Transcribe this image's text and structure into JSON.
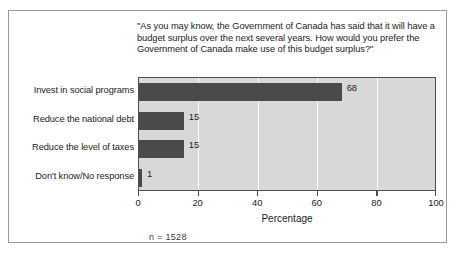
{
  "figure": {
    "question": "\"As you may know, the Government of Canada has said that it will have a budget surplus over the next several years. How would you prefer the Government of Canada make use of this budget surplus?\"",
    "sample_note": "n = 1528",
    "frame_border_color": "#9a9a9a",
    "plot_background_color": "#d8d8d8",
    "bar_color": "#4a4a4a",
    "gridline_color": "#ffffff"
  },
  "chart_data": {
    "type": "bar",
    "orientation": "horizontal",
    "title": "\"As you may know, the Government of Canada has said that it will have a budget surplus over the next several years. How would you prefer the Government of Canada make use of this budget surplus?\"",
    "categories": [
      "Invest in social programs",
      "Reduce the national debt",
      "Reduce the level of taxes",
      "Don't know/No response"
    ],
    "values": [
      68,
      15,
      15,
      1
    ],
    "data_labels": [
      "68",
      "15",
      "15",
      "1"
    ],
    "xlabel": "Percentage",
    "ylabel": "",
    "xlim": [
      0,
      100
    ],
    "xticks": [
      0,
      20,
      40,
      60,
      80,
      100
    ],
    "xtick_labels": [
      "0",
      "20",
      "40",
      "60",
      "80",
      "100"
    ],
    "grid": "vertical",
    "legend": "none",
    "annotations": [
      "n = 1528"
    ]
  }
}
